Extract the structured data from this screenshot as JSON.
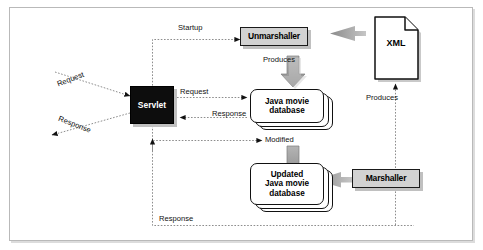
{
  "diagram": {
    "nodes": {
      "servlet": "Servlet",
      "unmarshaller": "Unmarshaller",
      "marshaller": "Marshaller",
      "xml": "XML",
      "java_db": "Java movie\ndatabase",
      "java_db_line1": "Java movie",
      "java_db_line2": "database",
      "updated_db_line1": "Updated",
      "updated_db_line2": "Java movie",
      "updated_db_line3": "database"
    },
    "labels": {
      "startup": "Startup",
      "produces_top": "Produces",
      "produces_right": "Produces",
      "request_in": "Request",
      "response_out": "Response",
      "request_mid": "Request",
      "response_mid": "Response",
      "modified": "Modified",
      "response_bottom": "Response"
    },
    "colors": {
      "box_fill": "#d2d2d2",
      "box_stroke": "#1a1a1a",
      "servlet_fill": "#0d0d0d",
      "servlet_text": "#ffffff",
      "block_arrow": "#9a9a9a",
      "dotted_line": "#8d8d8d",
      "frame_border": "#b9b9b9",
      "page_background": "#ffffff"
    }
  }
}
